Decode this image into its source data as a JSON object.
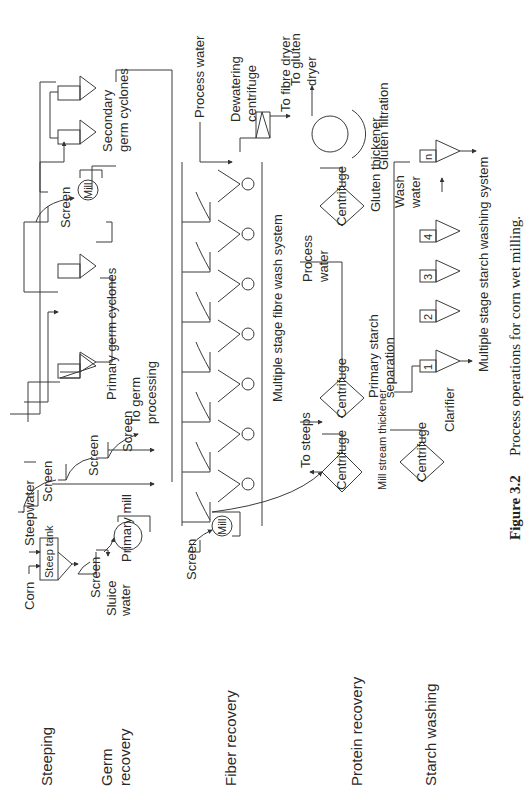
{
  "figure": {
    "number": "Figure 3.2",
    "caption": "Process operations for corn wet milling."
  },
  "stages": [
    {
      "id": "steeping",
      "label": "Steeping"
    },
    {
      "id": "germ",
      "label": "Germ",
      "label2": "recovery"
    },
    {
      "id": "fiber",
      "label": "Fiber recovery"
    },
    {
      "id": "protein",
      "label": "Protein recovery"
    },
    {
      "id": "starch",
      "label": "Starch washing"
    }
  ],
  "steeping": {
    "corn": "Corn",
    "steepwater": "Steepwater",
    "steep_tank": "Steep tank"
  },
  "germ_recovery": {
    "screen": "Screen",
    "sluice_water_1": "Sluice",
    "sluice_water_2": "water",
    "primary_mill": "Primary mill",
    "screens": [
      "Screen",
      "Screen",
      "Screen"
    ],
    "to_germ_processing_1": "To germ",
    "to_germ_processing_2": "processing",
    "primary_germ_cyclones": "Primary germ cyclones",
    "screen2": "Screen",
    "mill": "Mill",
    "secondary_germ_cyclones_1": "Secondary",
    "secondary_germ_cyclones_2": "germ cyclones"
  },
  "fiber_recovery": {
    "screen": "Screen",
    "mill": "Mill",
    "fibre_wash_system": "Multiple stage fibre wash system",
    "process_water": "Process water",
    "dewatering_centrifuge_1": "Dewatering",
    "dewatering_centrifuge_2": "centrifuge",
    "to_fibre_dryer": "To fibre dryer",
    "wash_stages": 6
  },
  "protein_recovery": {
    "centrifuge": "Centrifuge",
    "mill_stream_thickener": "Mill stream thickener",
    "to_steeps": "To steeps",
    "centrifuge2": "Centrifuge",
    "primary_starch_separation_1": "Primary starch",
    "primary_starch_separation_2": "separation",
    "process_water_1": "Process",
    "process_water_2": "water",
    "centrifuge3": "Centrifuge",
    "gluten_thickener": "Gluten thickener",
    "gluten_filtration": "Gluten filtration",
    "to_gluten_dryer_1": "To gluten",
    "to_gluten_dryer_2": "dryer"
  },
  "starch_washing": {
    "centrifuge": "Centrifuge",
    "clarifier": "Clarifier",
    "stages": [
      "1",
      "2",
      "3",
      "4",
      "n"
    ],
    "wash_water_1": "Wash",
    "wash_water_2": "water",
    "system_label": "Multiple stage starch washing system"
  }
}
